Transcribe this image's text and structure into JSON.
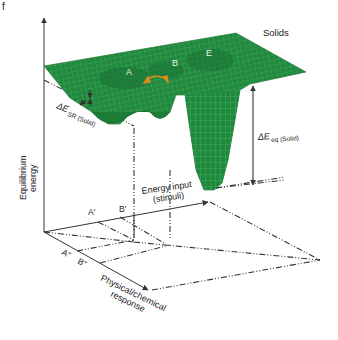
{
  "panel_label": "f",
  "title": "Solids",
  "colors": {
    "surface": "#1f8a3e",
    "surface_dark": "#15692d",
    "mesh": "#9fd3a8",
    "axis": "#333333",
    "arrow_orange": "#e08a1e"
  },
  "axes": {
    "y_label_line1": "Equilibrium",
    "y_label_line2": "energy",
    "x_label_line1": "Energy input",
    "x_label_line2": "(stimuli)",
    "z_label_line1": "Physical/chemical",
    "z_label_line2": "response"
  },
  "wells": {
    "a": "A",
    "b": "B",
    "e": "E"
  },
  "projections": {
    "a_prime": "A′",
    "b_prime": "B′",
    "a_double": "A″",
    "b_double": "B″"
  },
  "annotations": {
    "de_sr_main": "ΔE",
    "de_sr_sub": "SR (Solid)",
    "de_eq_main": "ΔE",
    "de_eq_sub": "eq (Solid)"
  }
}
